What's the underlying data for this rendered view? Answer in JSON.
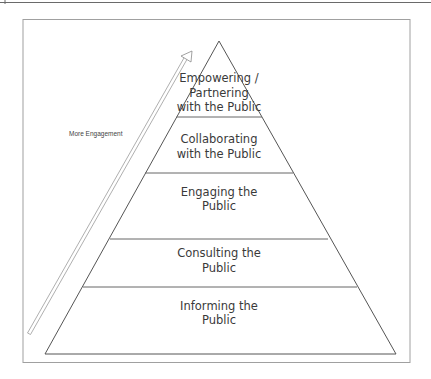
{
  "diagram": {
    "type": "pyramid",
    "arrow_label": "More Engagement",
    "tiers": [
      {
        "lines": [
          "Empowering /",
          "Partnering",
          "with the Public"
        ]
      },
      {
        "lines": [
          "Collaborating",
          "with the Public"
        ]
      },
      {
        "lines": [
          "Engaging the",
          "Public"
        ]
      },
      {
        "lines": [
          "Consulting the",
          "Public"
        ]
      },
      {
        "lines": [
          "Informing the",
          "Public"
        ]
      }
    ],
    "colors": {
      "line": "#555555",
      "frame": "#9a9a9a",
      "text": "#3a3a3a",
      "arrow": "#9a9a9a"
    }
  }
}
